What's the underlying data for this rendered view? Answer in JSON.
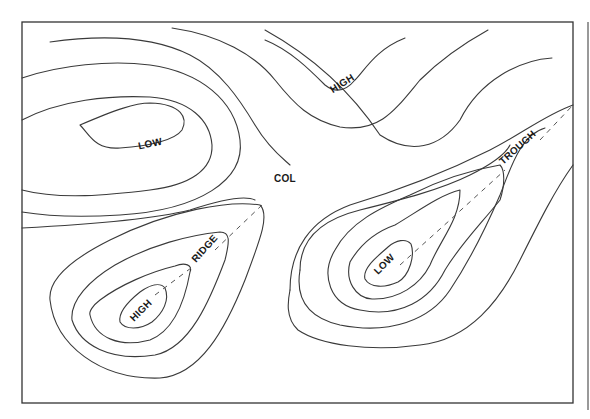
{
  "diagram": {
    "type": "pressure contour map",
    "colors": {
      "line": "#3a3a3a",
      "background": "#ffffff",
      "text": "#1a1a1a"
    },
    "labels": {
      "low_left": "LOW",
      "high_top": "HIGH",
      "col": "COL",
      "trough": "TROUGH",
      "low_right": "LOW",
      "ridge": "RIDGE",
      "high_bottom": "HIGH"
    },
    "features": [
      {
        "name": "LOW",
        "location": "upper-left",
        "kind": "closed low"
      },
      {
        "name": "HIGH",
        "location": "top-center",
        "kind": "high tongue"
      },
      {
        "name": "COL",
        "location": "center",
        "kind": "saddle"
      },
      {
        "name": "TROUGH",
        "location": "right",
        "kind": "trough axis (dashed)"
      },
      {
        "name": "LOW",
        "location": "lower-right",
        "kind": "closed low"
      },
      {
        "name": "RIDGE",
        "location": "lower-left",
        "kind": "ridge axis (dashed)"
      },
      {
        "name": "HIGH",
        "location": "lower-left",
        "kind": "closed high"
      }
    ]
  }
}
